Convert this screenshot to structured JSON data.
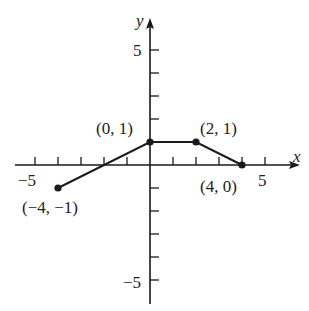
{
  "chart_data": {
    "type": "line",
    "title": "",
    "xlabel": "x",
    "ylabel": "y",
    "xlim": [
      -5.5,
      6.3
    ],
    "ylim": [
      -6,
      6.5
    ],
    "grid": false,
    "x_ticks": [
      -5,
      -4,
      -3,
      -2,
      -1,
      1,
      2,
      3,
      4,
      5
    ],
    "y_ticks": [
      -5,
      -4,
      -3,
      -2,
      -1,
      1,
      2,
      3,
      4,
      5
    ],
    "x_tick_labels": {
      "-5": "−5",
      "5": "5"
    },
    "y_tick_labels": {
      "5": "5",
      "-5": "−5"
    },
    "series": [
      {
        "name": "piecewise",
        "x": [
          -4,
          0,
          2,
          4
        ],
        "y": [
          -1,
          1,
          1,
          0
        ]
      }
    ],
    "points": [
      {
        "x": -4,
        "y": -1,
        "label": "(−4, −1)"
      },
      {
        "x": 0,
        "y": 1,
        "label": "(0, 1)"
      },
      {
        "x": 2,
        "y": 1,
        "label": "(2, 1)"
      },
      {
        "x": 4,
        "y": 0,
        "label": "(4, 0)"
      }
    ]
  },
  "labels": {
    "x_axis": "x",
    "y_axis": "y",
    "x_neg5": "−5",
    "x_pos5": "5",
    "y_pos5": "5",
    "y_neg5": "−5",
    "p1": "(−4, −1)",
    "p2": "(0, 1)",
    "p3": "(2, 1)",
    "p4": "(4, 0)"
  },
  "colors": {
    "ink": "#1a1a1a",
    "background": "#ffffff"
  }
}
